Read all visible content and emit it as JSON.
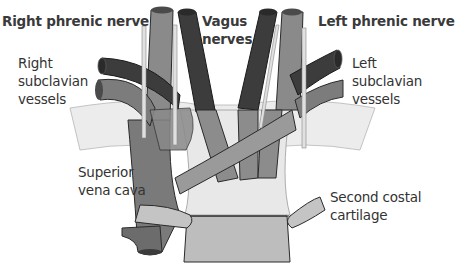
{
  "diagram": {
    "type": "anatomical-illustration",
    "labels": {
      "right_phrenic_nerve": "Right phrenic nerve",
      "vagus_nerves_line1": "Vagus",
      "vagus_nerves_line2": "nerves",
      "left_phrenic_nerve": "Left phrenic nerve",
      "right_subclavian_line1": "Right",
      "right_subclavian_line2": "subclavian",
      "right_subclavian_line3": "vessels",
      "left_subclavian_line1": "Left",
      "left_subclavian_line2": "subclavian",
      "left_subclavian_line3": "vessels",
      "svc_line1": "Superior",
      "svc_line2": "vena cava",
      "costal_line1": "Second costal",
      "costal_line2": "cartilage"
    },
    "colors": {
      "artery_dark": "#3c3c3c",
      "vein_mid": "#7c7c7c",
      "vein_light": "#9a9a9a",
      "nerve": "#e0e0e0",
      "rib_light": "#e6e6e6",
      "cartilage": "#c4c4c4",
      "sternum": "#bdbdbd",
      "manubrium": "#e8e8e8",
      "outline": "#2a2a2a"
    }
  }
}
